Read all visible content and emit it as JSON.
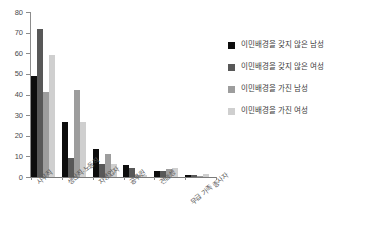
{
  "chart_data": {
    "type": "bar",
    "title": "",
    "xlabel": "",
    "ylabel": "",
    "ylim": [
      0,
      80
    ],
    "ytick_labels": [
      "0",
      "10",
      "20",
      "30",
      "40",
      "50",
      "60",
      "70",
      "80"
    ],
    "ytick_values": [
      0,
      10,
      20,
      30,
      40,
      50,
      60,
      70,
      80
    ],
    "grid": false,
    "legend_position": "right",
    "categories": [
      "사무직",
      "생산직·노동직",
      "자영업자",
      "공무원",
      "견습생",
      "무급 가족 종사자"
    ],
    "series": [
      {
        "name": "이민배경을 갖지 않은 남성",
        "color": "#0d0d0d",
        "values": [
          49,
          26.5,
          13.5,
          6,
          3,
          0.8
        ]
      },
      {
        "name": "이민배경을 갖지 않은 여성",
        "color": "#585858",
        "values": [
          72,
          9,
          6.5,
          4.5,
          3,
          1.2
        ]
      },
      {
        "name": "이민배경을 가진 남성",
        "color": "#9d9d9d",
        "values": [
          41,
          42,
          11,
          1,
          4,
          0.4
        ]
      },
      {
        "name": "이민배경을 가진 여성",
        "color": "#cfcfcf",
        "values": [
          59,
          26.5,
          6.5,
          1,
          4.5,
          1.3
        ]
      }
    ]
  },
  "axis": {
    "y_max_label": "80",
    "y_min_label": "0"
  },
  "colors": {
    "series_0": "#0d0d0d",
    "series_1": "#585858",
    "series_2": "#9d9d9d",
    "series_3": "#cfcfcf",
    "axis_line": "#8c8c8c",
    "background": "#ffffff",
    "text": "#3c3c3c"
  }
}
